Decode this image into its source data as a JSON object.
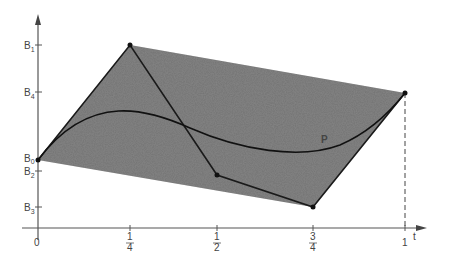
{
  "diagram": {
    "type": "bezier-control-polygon",
    "x_axis": {
      "label": "t",
      "ticks": [
        {
          "label": "0",
          "num": "",
          "den": "",
          "t": 0
        },
        {
          "label": "1/4",
          "num": "1",
          "den": "4",
          "t": 0.25
        },
        {
          "label": "1/2",
          "num": "1",
          "den": "2",
          "t": 0.5
        },
        {
          "label": "3/4",
          "num": "3",
          "den": "4",
          "t": 0.75
        },
        {
          "label": "1",
          "num": "",
          "den": "",
          "t": 1
        }
      ]
    },
    "y_axis": {
      "ticks": [
        {
          "name": "B",
          "sub": "1"
        },
        {
          "name": "B",
          "sub": "4"
        },
        {
          "name": "B",
          "sub": "0"
        },
        {
          "name": "B",
          "sub": "2"
        },
        {
          "name": "B",
          "sub": "3"
        }
      ]
    },
    "control_points": [
      {
        "name": "B0",
        "t": 0,
        "px": [
          38,
          160
        ]
      },
      {
        "name": "B1",
        "t": 0.25,
        "px": [
          130,
          45
        ]
      },
      {
        "name": "B2",
        "t": 0.5,
        "px": [
          217,
          175
        ]
      },
      {
        "name": "B3",
        "t": 0.75,
        "px": [
          313,
          207
        ]
      },
      {
        "name": "B4",
        "t": 1,
        "px": [
          405,
          93
        ]
      }
    ],
    "curve_label": "P",
    "colors": {
      "hull_fill": "#6e6e6e",
      "lines": "#1a1a1a",
      "axis": "#555555"
    }
  }
}
